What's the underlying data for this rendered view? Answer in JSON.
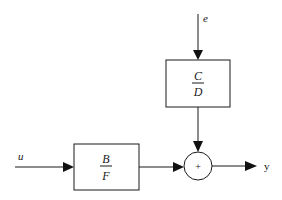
{
  "diagram": {
    "type": "block-diagram",
    "signals": {
      "input_u": "u",
      "input_e": "e",
      "output_y": "y"
    },
    "blocks": [
      {
        "id": "plant",
        "numerator": "B",
        "denominator": "F"
      },
      {
        "id": "noise",
        "numerator": "C",
        "denominator": "D"
      }
    ],
    "summing_junction": {
      "symbol": "+"
    },
    "connections": [
      {
        "from": "u",
        "to": "plant"
      },
      {
        "from": "e",
        "to": "noise"
      },
      {
        "from": "plant",
        "to": "summing_junction"
      },
      {
        "from": "noise",
        "to": "summing_junction"
      },
      {
        "from": "summing_junction",
        "to": "y"
      }
    ]
  }
}
